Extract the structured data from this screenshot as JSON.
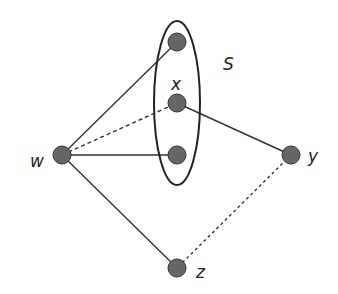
{
  "diagram": {
    "set": {
      "label": "S",
      "cx": 177,
      "cy": 103,
      "rx": 23,
      "ry": 82
    },
    "nodes": [
      {
        "id": "s1",
        "label": "",
        "x": 177,
        "y": 42
      },
      {
        "id": "x",
        "label": "x",
        "x": 177,
        "y": 103
      },
      {
        "id": "s3",
        "label": "",
        "x": 177,
        "y": 155
      },
      {
        "id": "w",
        "label": "w",
        "x": 62,
        "y": 155
      },
      {
        "id": "y",
        "label": "y",
        "x": 291,
        "y": 155
      },
      {
        "id": "z",
        "label": "z",
        "x": 177,
        "y": 268
      }
    ],
    "edges": [
      {
        "from": "w",
        "to": "s1",
        "style": "solid"
      },
      {
        "from": "w",
        "to": "x",
        "style": "dashed"
      },
      {
        "from": "w",
        "to": "s3",
        "style": "solid"
      },
      {
        "from": "w",
        "to": "z",
        "style": "solid"
      },
      {
        "from": "x",
        "to": "y",
        "style": "solid"
      },
      {
        "from": "y",
        "to": "z",
        "style": "dashed"
      }
    ],
    "colors": {
      "node_fill": "#666666",
      "node_stroke": "#333333",
      "line": "#333333"
    }
  }
}
